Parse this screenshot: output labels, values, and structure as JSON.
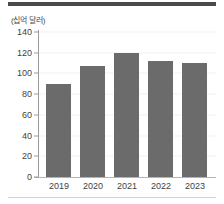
{
  "figure": {
    "unit_label": "(십억 달러)",
    "bar_color": "#6b6b6b",
    "rule_color": "#4a4a4a",
    "axis_color": "#9a9a9a"
  },
  "chart_data": {
    "type": "bar",
    "title": "",
    "subtitle": "",
    "xlabel": "",
    "ylabel": "(십억 달러)",
    "categories": [
      "2019",
      "2020",
      "2021",
      "2022",
      "2023"
    ],
    "values": [
      90,
      107,
      120,
      112,
      110
    ],
    "series": [
      {
        "name": "",
        "values": [
          90,
          107,
          120,
          112,
          110
        ]
      }
    ],
    "yticks": [
      0,
      20,
      40,
      60,
      80,
      100,
      120,
      140
    ],
    "ytick_labels": [
      "0",
      "20",
      "40",
      "60",
      "80",
      "100",
      "120",
      "140"
    ],
    "ylim": [
      0,
      140
    ],
    "grid": true,
    "legend": false,
    "legend_position": "none"
  }
}
